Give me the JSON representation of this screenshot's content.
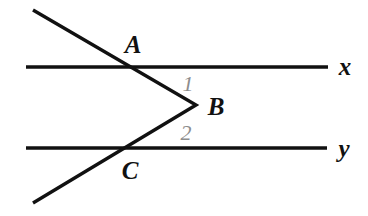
{
  "figure": {
    "background_color": "#ffffff",
    "width": 368,
    "height": 216,
    "stroke_color": "#111111",
    "angle_label_color": "#8d8d8d"
  },
  "lines": [
    {
      "name": "line-x",
      "label": "x",
      "label_x": 345,
      "label_y": 66,
      "x1": 26,
      "y1": 67,
      "x2": 328,
      "y2": 67,
      "thickness": 3.4,
      "color": "#111111"
    },
    {
      "name": "line-y",
      "label": "y",
      "label_x": 344,
      "label_y": 148,
      "x1": 26,
      "y1": 148,
      "x2": 327,
      "y2": 148,
      "thickness": 3.4,
      "color": "#111111"
    }
  ],
  "transversal": {
    "name": "zigzag-transversal",
    "thickness": 3.4,
    "color": "#111111",
    "points": [
      {
        "name": "upper-ray-start",
        "x": 33,
        "y": 10
      },
      {
        "name": "vertex-b",
        "x": 196,
        "y": 105
      },
      {
        "name": "lower-ray-end",
        "x": 33,
        "y": 203
      }
    ]
  },
  "points": [
    {
      "name": "point-a",
      "label": "A",
      "label_x": 133,
      "label_y": 44,
      "on": "line-x",
      "x": 125,
      "y": 66,
      "color": "#111111"
    },
    {
      "name": "point-b",
      "label": "B",
      "label_x": 216,
      "label_y": 106,
      "on": "transversal-vertex",
      "x": 196,
      "y": 105,
      "color": "#111111"
    },
    {
      "name": "point-c",
      "label": "C",
      "label_x": 130,
      "label_y": 170,
      "on": "line-y",
      "x": 128,
      "y": 147,
      "color": "#111111"
    }
  ],
  "angles": [
    {
      "name": "angle-1",
      "label": "1",
      "label_x": 188,
      "label_y": 84,
      "color": "#8d8d8d",
      "at_vertex": "B",
      "between": [
        "ray-BA",
        "line-x"
      ]
    },
    {
      "name": "angle-2",
      "label": "2",
      "label_x": 186,
      "label_y": 133,
      "color": "#8d8d8d",
      "at_vertex": "B",
      "between": [
        "ray-BC",
        "line-y"
      ]
    }
  ]
}
